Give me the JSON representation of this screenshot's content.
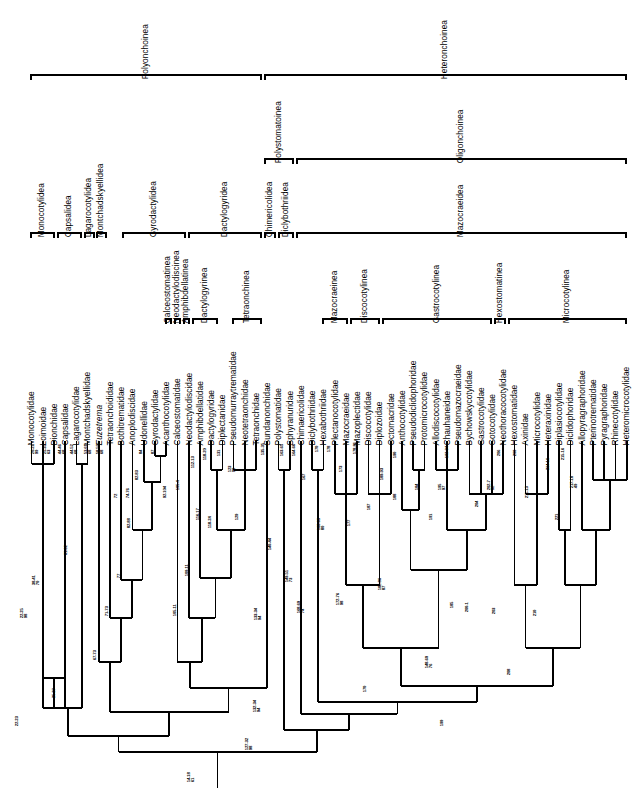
{
  "figure": {
    "type": "cladogram",
    "orientation": "rotated-90"
  },
  "rank_brackets": {
    "row1": [
      {
        "label": "Polyonchoinea",
        "x": 30,
        "w": 232
      },
      {
        "label": "Heteronchoinea",
        "x": 264,
        "w": 363
      }
    ],
    "row2": [
      {
        "label": "Polystomatoinea",
        "x": 264,
        "w": 30
      },
      {
        "label": "Oligonchoinea",
        "x": 296,
        "w": 331
      }
    ],
    "row3": [
      {
        "label": "Monocotylidea",
        "x": 30,
        "w": 25
      },
      {
        "label": "Capsalidea",
        "x": 57,
        "w": 25
      },
      {
        "label": "Lagarocotylidea",
        "x": 84,
        "w": 11
      },
      {
        "label": "Montchadskyellidea",
        "x": 96,
        "w": 11
      },
      {
        "label": "Gyrodactylidea",
        "x": 122,
        "w": 64
      },
      {
        "label": "Dactylogyridea",
        "x": 188,
        "w": 74
      },
      {
        "label": "Chimericolidea",
        "x": 264,
        "w": 12
      },
      {
        "label": "Diclybothriidea",
        "x": 278,
        "w": 16
      },
      {
        "label": "Mazocraeidea",
        "x": 296,
        "w": 331
      }
    ],
    "row4": [
      {
        "label": "Calceostomatinea",
        "x": 165,
        "w": 7
      },
      {
        "label": "Neodactylodiscinea",
        "x": 174,
        "w": 7
      },
      {
        "label": "Amphibdellatinea",
        "x": 183,
        "w": 7
      },
      {
        "label": "Dactylogyrinea",
        "x": 192,
        "w": 26
      },
      {
        "label": "Tetraonchinea",
        "x": 232,
        "w": 30
      },
      {
        "label": "Mazocraeinea",
        "x": 322,
        "w": 26
      },
      {
        "label": "Discocotylinea",
        "x": 350,
        "w": 30
      },
      {
        "label": "Gastrocotylinea",
        "x": 382,
        "w": 110
      },
      {
        "label": "Hexostomatinea",
        "x": 494,
        "w": 12
      },
      {
        "label": "Microcotylinea",
        "x": 508,
        "w": 119
      }
    ]
  },
  "taxa": [
    {
      "name": "Monocotylidae",
      "italic": false
    },
    {
      "name": "Loimoidae",
      "italic": false
    },
    {
      "name": "Dionchidae",
      "italic": false
    },
    {
      "name": "Capsalidae",
      "italic": false
    },
    {
      "name": "Lagarocotylidae",
      "italic": false
    },
    {
      "name": "Montchadskyellidae",
      "italic": false
    },
    {
      "name": "Euzetrema",
      "italic": true
    },
    {
      "name": "Tetraonchoididae",
      "italic": false
    },
    {
      "name": "Bothitrematidae",
      "italic": false
    },
    {
      "name": "Anoplodiscidae",
      "italic": false
    },
    {
      "name": "Udonellidae",
      "italic": false
    },
    {
      "name": "Gyrodactylidae",
      "italic": false
    },
    {
      "name": "Acanthocotylidae",
      "italic": false
    },
    {
      "name": "Calceostomatidae",
      "italic": false
    },
    {
      "name": "Neodactylodiscidae",
      "italic": false
    },
    {
      "name": "Amphibdellatidae",
      "italic": false
    },
    {
      "name": "Dactylogyridae",
      "italic": false
    },
    {
      "name": "Diplectanidae",
      "italic": false
    },
    {
      "name": "Pseudomurraytrematidae",
      "italic": false
    },
    {
      "name": "Neotetraonchidae",
      "italic": false
    },
    {
      "name": "Tetraonchidae",
      "italic": false
    },
    {
      "name": "Sundanonchidae",
      "italic": false
    },
    {
      "name": "Polystomatidae",
      "italic": false
    },
    {
      "name": "Sphyranuridae",
      "italic": false
    },
    {
      "name": "Chimaericolidae",
      "italic": false
    },
    {
      "name": "Diclybothriidae",
      "italic": false
    },
    {
      "name": "Hexabothriidae",
      "italic": false
    },
    {
      "name": "Plectanocotylidae",
      "italic": false
    },
    {
      "name": "Mazocraeidae",
      "italic": false
    },
    {
      "name": "Mazoplectidae",
      "italic": false
    },
    {
      "name": "Discocotylidae",
      "italic": false
    },
    {
      "name": "Diplozoidae",
      "italic": false
    },
    {
      "name": "Octomacridae",
      "italic": false
    },
    {
      "name": "Anthocotylidae",
      "italic": false
    },
    {
      "name": "Pseudodiclidophoridae",
      "italic": false
    },
    {
      "name": "Protomicrocotylidae",
      "italic": false
    },
    {
      "name": "Allodiscocotylidae",
      "italic": false
    },
    {
      "name": "Chauhaneidae",
      "italic": false
    },
    {
      "name": "Pseudomazocraeidae",
      "italic": false
    },
    {
      "name": "Bychowskycotylidae",
      "italic": false
    },
    {
      "name": "Gastrocotylidae",
      "italic": false
    },
    {
      "name": "Gotocotylidae",
      "italic": false
    },
    {
      "name": "Neothoracocotylidae",
      "italic": false
    },
    {
      "name": "Hexostomatidae",
      "italic": false
    },
    {
      "name": "Axinidae",
      "italic": false
    },
    {
      "name": "Microcotylidae",
      "italic": false
    },
    {
      "name": "Heteraxinidae",
      "italic": false
    },
    {
      "name": "Diplasiocotylidae",
      "italic": false
    },
    {
      "name": "Diclidophoridae",
      "italic": false
    },
    {
      "name": "Allopyragraphoridae",
      "italic": false
    },
    {
      "name": "Pterinotrematidae",
      "italic": false
    },
    {
      "name": "Pyragraphoridae",
      "italic": false
    },
    {
      "name": "Rhinecotylidae",
      "italic": false
    },
    {
      "name": "Heteromicrocotylidae",
      "italic": false
    }
  ],
  "node_labels": [
    {
      "chars": "20-21",
      "support": "99",
      "x": 36,
      "y": 434
    },
    {
      "chars": "25-33",
      "support": "63",
      "x": 48,
      "y": 434
    },
    {
      "chars": "44-46",
      "support": "68",
      "x": 63,
      "y": 434
    },
    {
      "chars": "44-52",
      "support": "68",
      "x": 75,
      "y": 434
    },
    {
      "chars": "53-61",
      "support": "68",
      "x": 89,
      "y": 434
    },
    {
      "chars": "58-59",
      "support": "68",
      "x": 101,
      "y": 434
    },
    {
      "chars": "61-62",
      "support": "",
      "x": 69,
      "y": 535
    },
    {
      "chars": "22-25",
      "support": "98",
      "x": 25,
      "y": 598
    },
    {
      "chars": "38-41",
      "support": "70",
      "x": 37,
      "y": 565
    },
    {
      "chars": "22-23",
      "support": "",
      "x": 20,
      "y": 706
    },
    {
      "chars": "25-27",
      "support": "",
      "x": 57,
      "y": 678
    },
    {
      "chars": "72",
      "support": "",
      "x": 119,
      "y": 478
    },
    {
      "chars": "74-76",
      "support": "",
      "x": 131,
      "y": 478
    },
    {
      "chars": "84",
      "support": "",
      "x": 144,
      "y": 434
    },
    {
      "chars": "87",
      "support": "",
      "x": 156,
      "y": 434
    },
    {
      "chars": "82-83",
      "support": "",
      "x": 140,
      "y": 460
    },
    {
      "chars": "82-88",
      "support": "",
      "x": 132,
      "y": 508
    },
    {
      "chars": "77",
      "support": "",
      "x": 122,
      "y": 558
    },
    {
      "chars": "71-73",
      "support": "",
      "x": 110,
      "y": 596
    },
    {
      "chars": "67-73",
      "support": "",
      "x": 98,
      "y": 640
    },
    {
      "chars": "92-104",
      "support": "",
      "x": 168,
      "y": 478
    },
    {
      "chars": "105-4",
      "support": "",
      "x": 181,
      "y": 470
    },
    {
      "chars": "112-13",
      "support": "",
      "x": 196,
      "y": 448
    },
    {
      "chars": "118-20",
      "support": "",
      "x": 208,
      "y": 440
    },
    {
      "chars": "131",
      "support": "",
      "x": 222,
      "y": 436
    },
    {
      "chars": "116-17",
      "support": "",
      "x": 201,
      "y": 500
    },
    {
      "chars": "118-24",
      "support": "",
      "x": 213,
      "y": 508
    },
    {
      "chars": "109-11",
      "support": "",
      "x": 190,
      "y": 556
    },
    {
      "chars": "105-11",
      "support": "",
      "x": 178,
      "y": 596
    },
    {
      "chars": "123",
      "support": "90",
      "x": 233,
      "y": 452
    },
    {
      "chars": "129",
      "support": "",
      "x": 240,
      "y": 500
    },
    {
      "chars": "133-34",
      "support": "94",
      "x": 259,
      "y": 600
    },
    {
      "chars": "135-35",
      "support": "",
      "x": 266,
      "y": 435
    },
    {
      "chars": "140-44",
      "support": "",
      "x": 273,
      "y": 530
    },
    {
      "chars": "163-65",
      "support": "",
      "x": 285,
      "y": 436
    },
    {
      "chars": "164-66",
      "support": "",
      "x": 297,
      "y": 436
    },
    {
      "chars": "149-51",
      "support": "73",
      "x": 290,
      "y": 562
    },
    {
      "chars": "167",
      "support": "",
      "x": 307,
      "y": 460
    },
    {
      "chars": "170",
      "support": "",
      "x": 320,
      "y": 432
    },
    {
      "chars": "178",
      "support": "",
      "x": 332,
      "y": 432
    },
    {
      "chars": "168-69",
      "support": "80",
      "x": 322,
      "y": 510
    },
    {
      "chars": "168-69",
      "support": "74",
      "x": 302,
      "y": 593
    },
    {
      "chars": "173",
      "support": "",
      "x": 344,
      "y": 452
    },
    {
      "chars": "178-81",
      "support": "",
      "x": 358,
      "y": 434
    },
    {
      "chars": "177",
      "support": "",
      "x": 352,
      "y": 506
    },
    {
      "chars": "172-76",
      "support": "98",
      "x": 341,
      "y": 585
    },
    {
      "chars": "187",
      "support": "",
      "x": 372,
      "y": 490
    },
    {
      "chars": "189-93",
      "support": "",
      "x": 385,
      "y": 460
    },
    {
      "chars": "190",
      "support": "",
      "x": 398,
      "y": 438
    },
    {
      "chars": "188",
      "support": "",
      "x": 398,
      "y": 480
    },
    {
      "chars": "182-86",
      "support": "87",
      "x": 383,
      "y": 570
    },
    {
      "chars": "184",
      "support": "",
      "x": 420,
      "y": 470
    },
    {
      "chars": "191",
      "support": "",
      "x": 434,
      "y": 500
    },
    {
      "chars": "192-94",
      "support": "",
      "x": 450,
      "y": 438
    },
    {
      "chars": "195",
      "support": "97",
      "x": 443,
      "y": 470
    },
    {
      "chars": "185",
      "support": "",
      "x": 455,
      "y": 588
    },
    {
      "chars": "148-60",
      "support": "76",
      "x": 430,
      "y": 648
    },
    {
      "chars": "170",
      "support": "",
      "x": 368,
      "y": 672
    },
    {
      "chars": "200-1",
      "support": "",
      "x": 470,
      "y": 592
    },
    {
      "chars": "204",
      "support": "",
      "x": 480,
      "y": 487
    },
    {
      "chars": "202-7",
      "support": "92",
      "x": 492,
      "y": 470
    },
    {
      "chars": "206",
      "support": "",
      "x": 502,
      "y": 436
    },
    {
      "chars": "208",
      "support": "",
      "x": 518,
      "y": 436
    },
    {
      "chars": "203",
      "support": "",
      "x": 497,
      "y": 594
    },
    {
      "chars": "211-13",
      "support": "",
      "x": 530,
      "y": 478
    },
    {
      "chars": "214-16",
      "support": "",
      "x": 551,
      "y": 450
    },
    {
      "chars": "215-16",
      "support": "",
      "x": 566,
      "y": 440
    },
    {
      "chars": "217-18",
      "support": "49",
      "x": 575,
      "y": 468
    },
    {
      "chars": "221",
      "support": "",
      "x": 560,
      "y": 500
    },
    {
      "chars": "210",
      "support": "",
      "x": 538,
      "y": 596
    },
    {
      "chars": "208",
      "support": "",
      "x": 512,
      "y": 655
    },
    {
      "chars": "199",
      "support": "",
      "x": 445,
      "y": 706
    },
    {
      "chars": "132-34",
      "support": "94",
      "x": 258,
      "y": 692
    },
    {
      "chars": "127-32",
      "support": "98",
      "x": 250,
      "y": 730
    },
    {
      "chars": "14-18",
      "support": "61",
      "x": 192,
      "y": 762
    }
  ]
}
